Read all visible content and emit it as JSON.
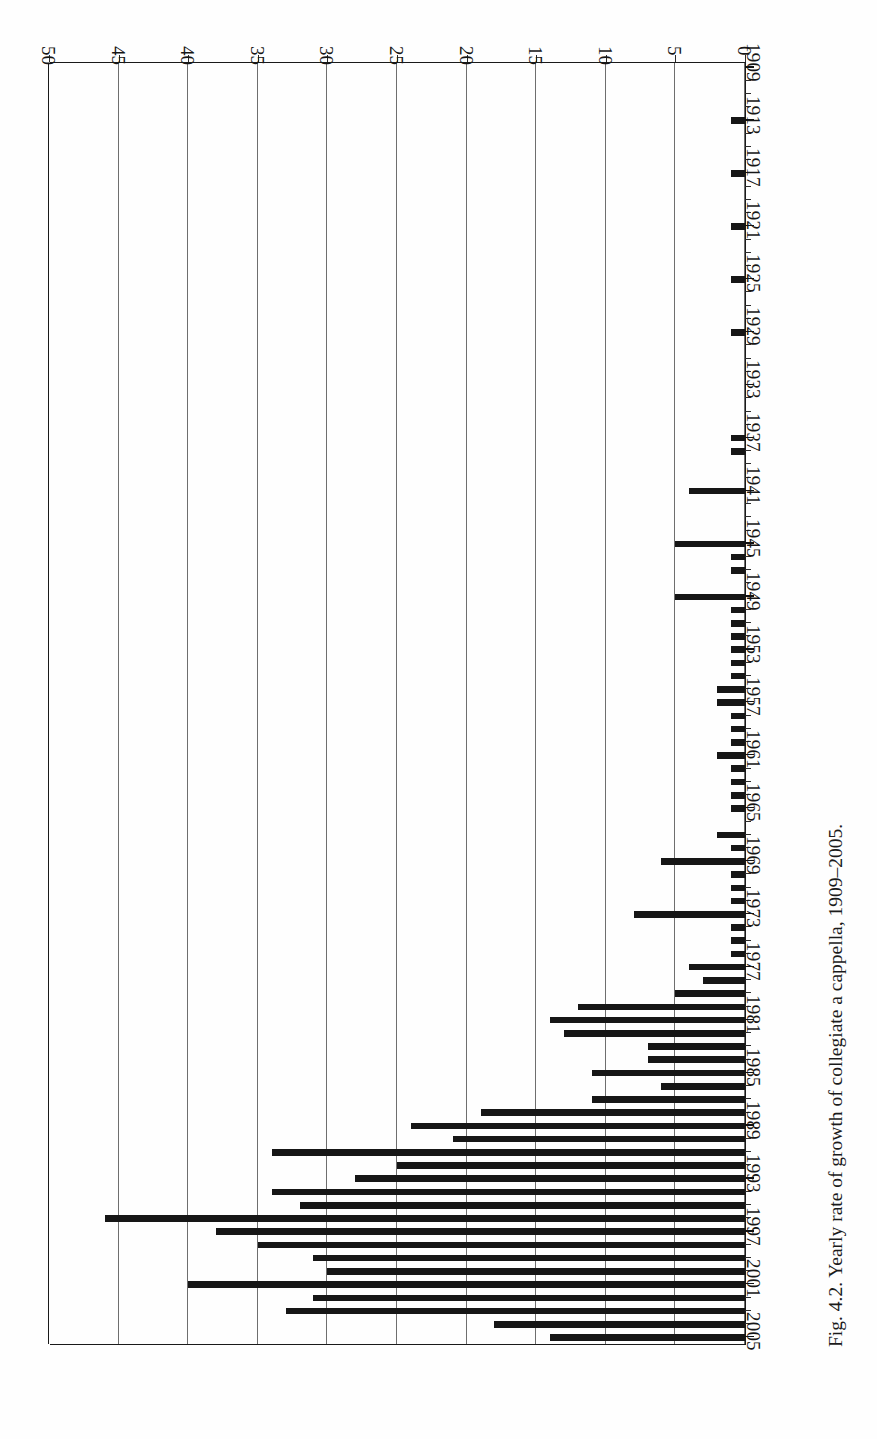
{
  "figure": {
    "caption": "Fig. 4.2. Yearly rate of growth of collegiate a cappella, 1909–2005.",
    "orientation_note": "rotated-180"
  },
  "chart_data": {
    "type": "bar",
    "orientation": "horizontal",
    "title": "Yearly rate of growth of collegiate a cappella, 1909–2005",
    "xlabel": "",
    "ylabel": "",
    "xlim": [
      0,
      50
    ],
    "xticks": [
      0,
      5,
      10,
      15,
      20,
      25,
      30,
      35,
      40,
      45,
      50
    ],
    "xtick_labels": [
      "0",
      "5",
      "10",
      "15",
      "20",
      "25",
      "30",
      "35",
      "40",
      "45",
      "50"
    ],
    "grid": true,
    "grid_axis": "x",
    "legend": null,
    "bar_color": "#161616",
    "category_label_interval": 4,
    "labeled_categories": [
      "1909",
      "1913",
      "1917",
      "1921",
      "1925",
      "1929",
      "1933",
      "1937",
      "1941",
      "1945",
      "1949",
      "1953",
      "1957",
      "1961",
      "1965",
      "1969",
      "1973",
      "1977",
      "1981",
      "1985",
      "1989",
      "1993",
      "1997",
      "2001",
      "2005"
    ],
    "categories": [
      "1909",
      "1910",
      "1911",
      "1912",
      "1913",
      "1914",
      "1915",
      "1916",
      "1917",
      "1918",
      "1919",
      "1920",
      "1921",
      "1922",
      "1923",
      "1924",
      "1925",
      "1926",
      "1927",
      "1928",
      "1929",
      "1930",
      "1931",
      "1932",
      "1933",
      "1934",
      "1935",
      "1936",
      "1937",
      "1938",
      "1939",
      "1940",
      "1941",
      "1942",
      "1943",
      "1944",
      "1945",
      "1946",
      "1947",
      "1948",
      "1949",
      "1950",
      "1951",
      "1952",
      "1953",
      "1954",
      "1955",
      "1956",
      "1957",
      "1958",
      "1959",
      "1960",
      "1961",
      "1962",
      "1963",
      "1964",
      "1965",
      "1966",
      "1967",
      "1968",
      "1969",
      "1970",
      "1971",
      "1972",
      "1973",
      "1974",
      "1975",
      "1976",
      "1977",
      "1978",
      "1979",
      "1980",
      "1981",
      "1982",
      "1983",
      "1984",
      "1985",
      "1986",
      "1987",
      "1988",
      "1989",
      "1990",
      "1991",
      "1992",
      "1993",
      "1994",
      "1995",
      "1996",
      "1997",
      "1998",
      "1999",
      "2000",
      "2001",
      "2002",
      "2003",
      "2004",
      "2005"
    ],
    "values": [
      0,
      0,
      0,
      0,
      1,
      0,
      0,
      0,
      1,
      0,
      0,
      0,
      1,
      0,
      0,
      0,
      1,
      0,
      0,
      0,
      1,
      0,
      0,
      0,
      0,
      0,
      0,
      0,
      1,
      1,
      0,
      0,
      4,
      0,
      0,
      0,
      5,
      1,
      1,
      0,
      5,
      1,
      1,
      1,
      1,
      1,
      1,
      2,
      2,
      1,
      1,
      1,
      2,
      1,
      1,
      1,
      1,
      0,
      2,
      1,
      6,
      1,
      1,
      1,
      8,
      1,
      1,
      1,
      4,
      3,
      5,
      12,
      14,
      13,
      7,
      7,
      11,
      6,
      11,
      19,
      24,
      21,
      34,
      25,
      28,
      34,
      32,
      46,
      38,
      35,
      31,
      30,
      40,
      31,
      33,
      18,
      14
    ]
  },
  "axes": {
    "value_axis_labels": [
      "50",
      "45",
      "40",
      "35",
      "30",
      "25",
      "20",
      "15",
      "10",
      "5",
      "0"
    ]
  }
}
